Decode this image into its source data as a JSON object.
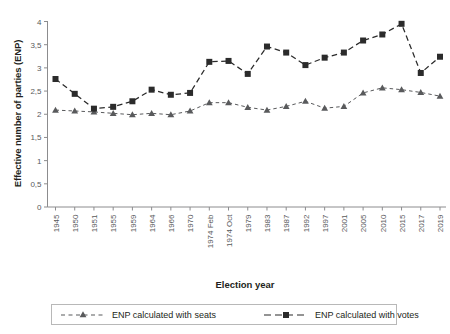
{
  "chart_data": {
    "type": "line",
    "title": "",
    "xlabel": "Election year",
    "ylabel": "Effective number of parties (ENP)",
    "categories": [
      "1945",
      "1950",
      "1951",
      "1955",
      "1959",
      "1964",
      "1966",
      "1970",
      "1974 Feb",
      "1974 Oct",
      "1979",
      "1983",
      "1987",
      "1992",
      "1997",
      "2001",
      "2005",
      "2010",
      "2015",
      "2017",
      "2019"
    ],
    "ylim": [
      0,
      4
    ],
    "yticks": [
      0,
      0.5,
      1,
      1.5,
      2,
      2.5,
      3,
      3.5,
      4
    ],
    "ytick_labels": [
      "0",
      "0,5",
      "1",
      "1,5",
      "2",
      "2,5",
      "3",
      "3,5",
      "4"
    ],
    "grid": false,
    "legend_position": "below",
    "series": [
      {
        "name": "ENP calculated with seats",
        "marker": "triangle",
        "linestyle": "dashed",
        "color": "#595a5c",
        "values": [
          2.09,
          2.07,
          2.05,
          2.02,
          1.99,
          2.02,
          1.99,
          2.07,
          2.25,
          2.25,
          2.15,
          2.09,
          2.17,
          2.28,
          2.13,
          2.17,
          2.46,
          2.57,
          2.53,
          2.47,
          2.39
        ]
      },
      {
        "name": "ENP calculated with votes",
        "marker": "square",
        "linestyle": "dashed",
        "color": "#2b2b2b",
        "values": [
          2.76,
          2.44,
          2.12,
          2.16,
          2.28,
          2.53,
          2.42,
          2.46,
          3.13,
          3.15,
          2.87,
          3.46,
          3.33,
          3.06,
          3.22,
          3.33,
          3.59,
          3.72,
          3.95,
          2.89,
          3.24
        ]
      }
    ]
  }
}
